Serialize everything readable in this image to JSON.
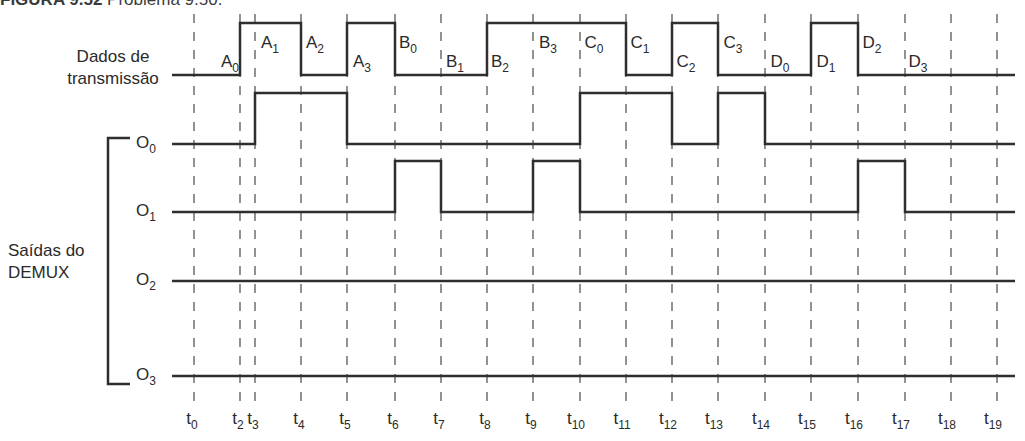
{
  "title": {
    "figure_label": "FIGURA 9.52",
    "caption": "Problema 9.50."
  },
  "labels": {
    "data_line_1": "Dados de",
    "data_line_2": "transmissão",
    "demux_line_1": "Saídas do",
    "demux_line_2": "DEMUX"
  },
  "colors": {
    "line": "#2e2e2e",
    "dash": "#4a4a4a",
    "text": "#2a2a2a",
    "background": "#ffffff"
  },
  "time_markers": [
    {
      "label": "t",
      "sub": "0",
      "x": 194
    },
    {
      "label": "t",
      "sub": "2",
      "x": 240
    },
    {
      "label": "t",
      "sub": "3",
      "x": 255
    },
    {
      "label": "t",
      "sub": "4",
      "x": 301
    },
    {
      "label": "t",
      "sub": "5",
      "x": 347
    },
    {
      "label": "t",
      "sub": "6",
      "x": 395
    },
    {
      "label": "t",
      "sub": "7",
      "x": 441
    },
    {
      "label": "t",
      "sub": "8",
      "x": 487
    },
    {
      "label": "t",
      "sub": "9",
      "x": 533
    },
    {
      "label": "t",
      "sub": "10",
      "x": 580
    },
    {
      "label": "t",
      "sub": "11",
      "x": 626
    },
    {
      "label": "t",
      "sub": "12",
      "x": 672
    },
    {
      "label": "t",
      "sub": "13",
      "x": 718
    },
    {
      "label": "t",
      "sub": "14",
      "x": 765
    },
    {
      "label": "t",
      "sub": "15",
      "x": 811
    },
    {
      "label": "t",
      "sub": "16",
      "x": 858
    },
    {
      "label": "t",
      "sub": "17",
      "x": 905
    },
    {
      "label": "t",
      "sub": "18",
      "x": 951
    },
    {
      "label": "t",
      "sub": "19",
      "x": 997
    }
  ],
  "signals": [
    {
      "name": "Dados de transmissão",
      "y_high": 23,
      "y_low": 75,
      "x_start": 172,
      "x_end": 1015,
      "levels": [
        0,
        1,
        1,
        0,
        1,
        0,
        0,
        1,
        1,
        1,
        0,
        1,
        0,
        0,
        1,
        0,
        0,
        0
      ],
      "note": "levels per interval t0-t2, t2-t3, ... (from t0 marker index)"
    },
    {
      "name": "O0",
      "sub": "0",
      "y_high": 93,
      "y_low": 144,
      "x_start": 172,
      "x_end": 1015,
      "levels": [
        0,
        0,
        1,
        1,
        0,
        0,
        0,
        0,
        0,
        1,
        1,
        0,
        1,
        0,
        0,
        0,
        0,
        0
      ]
    },
    {
      "name": "O1",
      "sub": "1",
      "y_high": 161,
      "y_low": 212,
      "x_start": 172,
      "x_end": 1015,
      "levels": [
        0,
        0,
        0,
        0,
        0,
        1,
        0,
        0,
        1,
        0,
        0,
        0,
        0,
        0,
        0,
        1,
        0,
        0
      ]
    },
    {
      "name": "O2",
      "sub": "2",
      "y_high": 281,
      "y_low": 281,
      "x_start": 172,
      "x_end": 1015,
      "levels": [
        0,
        0,
        0,
        0,
        0,
        0,
        0,
        0,
        0,
        0,
        0,
        0,
        0,
        0,
        0,
        0,
        0,
        0
      ]
    },
    {
      "name": "O3",
      "sub": "3",
      "y_high": 376,
      "y_low": 376,
      "x_start": 172,
      "x_end": 1015,
      "levels": [
        0,
        0,
        0,
        0,
        0,
        0,
        0,
        0,
        0,
        0,
        0,
        0,
        0,
        0,
        0,
        0,
        0,
        0
      ]
    }
  ],
  "data_bit_labels": [
    {
      "base": "A",
      "sub": "0",
      "x": 230,
      "pos": "low"
    },
    {
      "base": "A",
      "sub": "1",
      "x": 270,
      "pos": "high"
    },
    {
      "base": "A",
      "sub": "2",
      "x": 315,
      "pos": "high"
    },
    {
      "base": "A",
      "sub": "3",
      "x": 362,
      "pos": "low"
    },
    {
      "base": "B",
      "sub": "0",
      "x": 408,
      "pos": "high"
    },
    {
      "base": "B",
      "sub": "1",
      "x": 455,
      "pos": "low"
    },
    {
      "base": "B",
      "sub": "2",
      "x": 500,
      "pos": "low"
    },
    {
      "base": "B",
      "sub": "3",
      "x": 548,
      "pos": "high"
    },
    {
      "base": "C",
      "sub": "0",
      "x": 594,
      "pos": "high"
    },
    {
      "base": "C",
      "sub": "1",
      "x": 640,
      "pos": "high"
    },
    {
      "base": "C",
      "sub": "2",
      "x": 686,
      "pos": "low"
    },
    {
      "base": "C",
      "sub": "3",
      "x": 733,
      "pos": "high"
    },
    {
      "base": "D",
      "sub": "0",
      "x": 780,
      "pos": "low"
    },
    {
      "base": "D",
      "sub": "1",
      "x": 826,
      "pos": "low"
    },
    {
      "base": "D",
      "sub": "2",
      "x": 872,
      "pos": "high"
    },
    {
      "base": "D",
      "sub": "3",
      "x": 918,
      "pos": "low"
    }
  ],
  "output_labels": [
    {
      "base": "O",
      "sub": "0",
      "y": 148
    },
    {
      "base": "O",
      "sub": "1",
      "y": 216
    },
    {
      "base": "O",
      "sub": "2",
      "y": 285
    },
    {
      "base": "O",
      "sub": "3",
      "y": 380
    }
  ]
}
